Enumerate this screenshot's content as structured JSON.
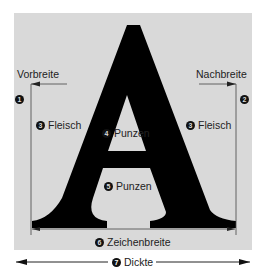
{
  "diagram": {
    "glyph": "A",
    "labels": {
      "vorbreite": "Vorbreite",
      "nachbreite": "Nachbreite",
      "fleisch_left": "Fleisch",
      "fleisch_right": "Fleisch",
      "punzen_upper": "Punzen",
      "punzen_lower": "Punzen",
      "zeichenbreite": "Zeichenbreite",
      "dickte": "Dickte"
    },
    "markers": {
      "vorbreite": "1",
      "nachbreite": "2",
      "fleisch": "3",
      "punzen_upper": "4",
      "punzen_lower": "5",
      "zeichenbreite": "6",
      "dickte": "7"
    },
    "colors": {
      "panel": "#d9d9d9",
      "glyph": "#000000",
      "lines": "#333333"
    }
  }
}
